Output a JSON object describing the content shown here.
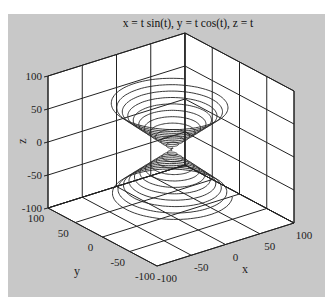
{
  "chart_data": {
    "type": "line3d",
    "title": "x = t sin(t), y = t cos(t), z = t",
    "xlabel": "x",
    "ylabel": "y",
    "zlabel": "z",
    "xlim": [
      -100,
      100
    ],
    "ylim": [
      -100,
      100
    ],
    "zlim": [
      -100,
      100
    ],
    "x_ticks": [
      "-100",
      "-50",
      "0",
      "50",
      "100"
    ],
    "y_ticks": [
      "-100",
      "-50",
      "0",
      "50",
      "100"
    ],
    "z_ticks": [
      "-100",
      "-50",
      "0",
      "50",
      "100"
    ],
    "grid": true,
    "series": [
      {
        "name": "helix",
        "parametric": {
          "x": "t*sin(t)",
          "y": "t*cos(t)",
          "z": "t"
        },
        "t_range": [
          -70,
          70
        ],
        "color": "#222222"
      }
    ]
  },
  "colors": {
    "panel_bg": "#c8c8c8",
    "axes_bg": "#ffffff",
    "line": "#222222"
  }
}
